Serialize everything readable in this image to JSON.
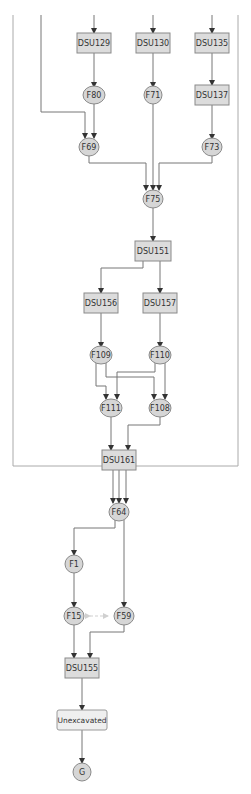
{
  "diagram": {
    "type": "harris-matrix",
    "colors": {
      "node_fill": "#dcdcdc",
      "circle_fill": "#d6d6d6",
      "unexcavated_fill": "#efefef",
      "edge": "#777777",
      "border": "#aaaaaa"
    },
    "nodes": {
      "DSU129": "DSU129",
      "DSU130": "DSU130",
      "DSU135": "DSU135",
      "F80": "F80",
      "F71": "F71",
      "DSU137": "DSU137",
      "F69": "F69",
      "F73": "F73",
      "F75": "F75",
      "DSU151": "DSU151",
      "DSU156": "DSU156",
      "DSU157": "DSU157",
      "F109": "F109",
      "F110": "F110",
      "F111": "F111",
      "F108": "F108",
      "DSU161": "DSU161",
      "F64": "F64",
      "F1": "F1",
      "F15": "F15",
      "F59": "F59",
      "DSU155": "DSU155",
      "Unexcavated": "Unexcavated",
      "G": "G"
    },
    "edges": [
      [
        "DSU129",
        "F80"
      ],
      [
        "DSU130",
        "F71"
      ],
      [
        "DSU135",
        "DSU137"
      ],
      [
        "F80",
        "F69"
      ],
      [
        "DSU137",
        "F73"
      ],
      [
        "F69",
        "F75"
      ],
      [
        "F71",
        "F75"
      ],
      [
        "F73",
        "F75"
      ],
      [
        "F75",
        "DSU151"
      ],
      [
        "DSU151",
        "DSU156"
      ],
      [
        "DSU151",
        "DSU157"
      ],
      [
        "DSU156",
        "F109"
      ],
      [
        "DSU157",
        "F110"
      ],
      [
        "F109",
        "F111"
      ],
      [
        "F109",
        "F108"
      ],
      [
        "F110",
        "F111"
      ],
      [
        "F110",
        "F108"
      ],
      [
        "F111",
        "DSU161"
      ],
      [
        "F108",
        "DSU161"
      ],
      [
        "DSU161",
        "F64"
      ],
      [
        "F64",
        "F1"
      ],
      [
        "F64",
        "F59"
      ],
      [
        "F1",
        "F15"
      ],
      [
        "F15",
        "DSU155"
      ],
      [
        "F59",
        "DSU155"
      ],
      [
        "DSU155",
        "Unexcavated"
      ],
      [
        "Unexcavated",
        "G"
      ]
    ],
    "equivalences": [
      [
        "F15",
        "F59"
      ]
    ]
  }
}
